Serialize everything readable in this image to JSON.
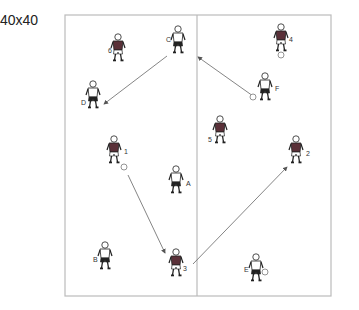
{
  "title": "40x40",
  "field": {
    "x": 65,
    "y": 15,
    "width": 266,
    "height": 281,
    "divider_x": 197,
    "line_color": "#bbbbbb"
  },
  "players": [
    {
      "id": "C",
      "team": "white",
      "x": 178,
      "y": 40,
      "label_dx": -12,
      "label_dy": 2
    },
    {
      "id": "6",
      "team": "dark",
      "x": 118,
      "y": 48,
      "label_dx": -10,
      "label_dy": 5
    },
    {
      "id": "4",
      "team": "dark",
      "x": 281,
      "y": 38,
      "label_dx": 8,
      "label_dy": 4
    },
    {
      "id": "D",
      "team": "white",
      "x": 93,
      "y": 95,
      "label_dx": -12,
      "label_dy": 10
    },
    {
      "id": "F",
      "team": "white",
      "x": 265,
      "y": 87,
      "label_dx": 10,
      "label_dy": 4
    },
    {
      "id": "5",
      "team": "dark",
      "x": 220,
      "y": 130,
      "label_dx": -12,
      "label_dy": 12
    },
    {
      "id": "1",
      "team": "dark",
      "x": 114,
      "y": 150,
      "label_dx": 10,
      "label_dy": 4
    },
    {
      "id": "2",
      "team": "dark",
      "x": 296,
      "y": 150,
      "label_dx": 10,
      "label_dy": 6
    },
    {
      "id": "A",
      "team": "white",
      "x": 176,
      "y": 180,
      "label_dx": 10,
      "label_dy": 6
    },
    {
      "id": "B",
      "team": "white",
      "x": 105,
      "y": 256,
      "label_dx": -12,
      "label_dy": 6
    },
    {
      "id": "3",
      "team": "dark",
      "x": 176,
      "y": 263,
      "label_dx": 7,
      "label_dy": 8
    },
    {
      "id": "E",
      "team": "white",
      "x": 256,
      "y": 268,
      "label_dx": -12,
      "label_dy": 4
    }
  ],
  "balls": [
    {
      "x": 281,
      "y": 55
    },
    {
      "x": 253,
      "y": 97
    },
    {
      "x": 124,
      "y": 167
    },
    {
      "x": 265,
      "y": 272
    }
  ],
  "passes": [
    {
      "from": [
        167,
        56
      ],
      "to": [
        104,
        104
      ],
      "arrow": "end"
    },
    {
      "from": [
        253,
        96
      ],
      "to": [
        198,
        57
      ],
      "arrow": "end"
    },
    {
      "from": [
        128,
        175
      ],
      "to": [
        165,
        253
      ],
      "arrow": "end"
    },
    {
      "from": [
        193,
        264
      ],
      "to": [
        287,
        167
      ],
      "arrow": "end"
    }
  ],
  "colors": {
    "dark_shirt": "#5a3038",
    "white_shirt": "#ffffff",
    "outline": "#222222",
    "pass_line": "#666666",
    "ball": "#888888"
  }
}
